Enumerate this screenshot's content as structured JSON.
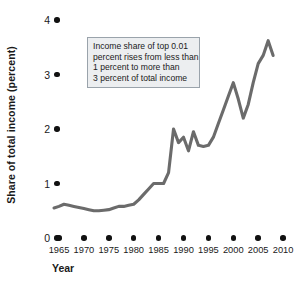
{
  "chart_data": {
    "type": "line",
    "title": "",
    "xlabel": "Year",
    "ylabel": "Share of total income (percent)",
    "xlim": [
      1963,
      2011
    ],
    "ylim": [
      0,
      4
    ],
    "grid": false,
    "legend": null,
    "line_color": "#6b6b6b",
    "annotation_text_lines": [
      "Income share of top 0.01",
      "percent rises from less than",
      "1 percent to more than",
      "3 percent of total income"
    ],
    "ytick_labels": [
      "0",
      "1",
      "2",
      "3",
      "4"
    ],
    "ytick_values": [
      0,
      1,
      2,
      3,
      4
    ],
    "xtick_labels": [
      "1965",
      "1970",
      "1975",
      "1980",
      "1985",
      "1990",
      "1995",
      "2000",
      "2005",
      "2010"
    ],
    "xtick_values": [
      1965,
      1970,
      1975,
      1980,
      1985,
      1990,
      1995,
      2000,
      2005,
      2010
    ],
    "x": [
      1964,
      1965,
      1966,
      1967,
      1968,
      1969,
      1970,
      1971,
      1972,
      1973,
      1974,
      1975,
      1976,
      1977,
      1978,
      1979,
      1980,
      1981,
      1982,
      1983,
      1984,
      1985,
      1986,
      1987,
      1988,
      1989,
      1990,
      1991,
      1992,
      1993,
      1994,
      1995,
      1996,
      1997,
      1998,
      1999,
      2000,
      2001,
      2002,
      2003,
      2004,
      2005,
      2006,
      2007,
      2008
    ],
    "values": [
      0.55,
      0.58,
      0.62,
      0.6,
      0.58,
      0.56,
      0.54,
      0.52,
      0.5,
      0.5,
      0.51,
      0.52,
      0.55,
      0.58,
      0.58,
      0.6,
      0.62,
      0.7,
      0.8,
      0.9,
      1.0,
      1.0,
      1.0,
      1.2,
      2.0,
      1.75,
      1.85,
      1.6,
      1.95,
      1.7,
      1.68,
      1.7,
      1.85,
      2.1,
      2.35,
      2.6,
      2.85,
      2.55,
      2.2,
      2.45,
      2.85,
      3.2,
      3.35,
      3.62,
      3.35
    ]
  }
}
